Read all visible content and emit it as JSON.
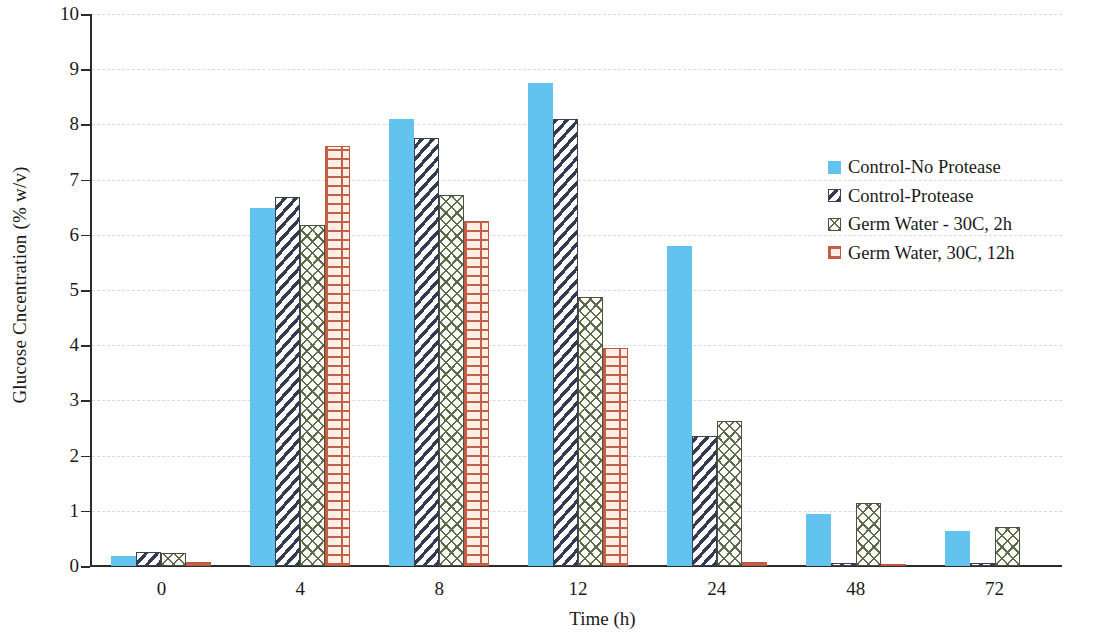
{
  "chart_data": {
    "type": "bar",
    "title": "",
    "xlabel": "Time (h)",
    "ylabel": "Glucose Cncentration (% w/v)",
    "categories": [
      "0",
      "4",
      "8",
      "12",
      "24",
      "48",
      "72"
    ],
    "ylim": [
      0,
      10
    ],
    "yticks": [
      "0",
      "1",
      "2",
      "3",
      "4",
      "5",
      "6",
      "7",
      "8",
      "9",
      "10"
    ],
    "grid": "horizontal-dashed",
    "legend_position": "right-upper",
    "series": [
      {
        "name": "Control-No Protease",
        "color": "#62c3ef",
        "pattern": "solid",
        "values": [
          0.18,
          6.48,
          8.1,
          8.75,
          5.8,
          0.95,
          0.63
        ]
      },
      {
        "name": "Control-Protease",
        "color": "#343a52",
        "pattern": "diagonal-hatch",
        "values": [
          0.25,
          6.68,
          7.75,
          8.1,
          2.35,
          0.05,
          0.05
        ]
      },
      {
        "name": "Germ Water - 30C, 2h",
        "color": "#5d6a4c",
        "pattern": "crosshatch",
        "values": [
          0.23,
          6.18,
          6.73,
          4.88,
          2.62,
          1.15,
          0.7
        ]
      },
      {
        "name": "Germ Water, 30C, 12h",
        "color": "#c4604a",
        "pattern": "brick",
        "values": [
          0.08,
          7.6,
          6.25,
          3.95,
          0.08,
          0.02,
          0.0
        ]
      }
    ]
  }
}
